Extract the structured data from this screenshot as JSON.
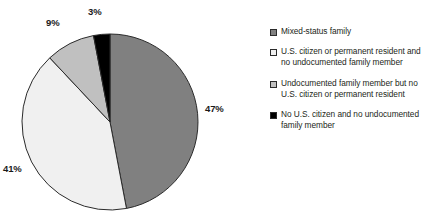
{
  "chart_data": {
    "type": "pie",
    "title": "",
    "subtitle": "",
    "xlabel": "",
    "ylabel": "",
    "grid": false,
    "legend_position": "right",
    "units": "percent",
    "start_angle_deg": 0,
    "direction": "clockwise",
    "categories": [
      "Mixed-status family",
      "U.S. citizen or permanent resident and no undocumented family member",
      "Undocumented family member but no U.S. citizen or permanent resident",
      "No U.S. citizen and no undocumented family member"
    ],
    "values": [
      47,
      41,
      9,
      3
    ],
    "data_labels": [
      "47%",
      "41%",
      "9%",
      "3%"
    ],
    "colors": [
      "#808080",
      "#f0f0f0",
      "#c0c0c0",
      "#000000"
    ],
    "slices": [
      {
        "label": "Mixed-status family",
        "value": 47,
        "data_label": "47%",
        "color": "#808080"
      },
      {
        "label": "U.S. citizen or permanent resident and no undocumented family member",
        "value": 41,
        "data_label": "41%",
        "color": "#f0f0f0"
      },
      {
        "label": "Undocumented family member but no U.S. citizen or permanent resident",
        "value": 9,
        "data_label": "9%",
        "color": "#c0c0c0"
      },
      {
        "label": "No U.S. citizen and no undocumented family member",
        "value": 3,
        "data_label": "3%",
        "color": "#000000"
      }
    ]
  },
  "pie": {
    "labels": [
      "47%",
      "41%",
      "9%",
      "3%"
    ]
  },
  "legend": {
    "items": [
      {
        "label": "Mixed-status family",
        "color": "#808080"
      },
      {
        "label": "U.S. citizen or permanent resident and no undocumented family member",
        "color": "#f0f0f0"
      },
      {
        "label": "Undocumented family member but no U.S. citizen or permanent resident",
        "color": "#c0c0c0"
      },
      {
        "label": "No U.S. citizen and no undocumented family member",
        "color": "#000000"
      }
    ]
  },
  "style": {
    "background": "#ffffff",
    "outline": "#2b2b2b",
    "text": "#231f20"
  }
}
